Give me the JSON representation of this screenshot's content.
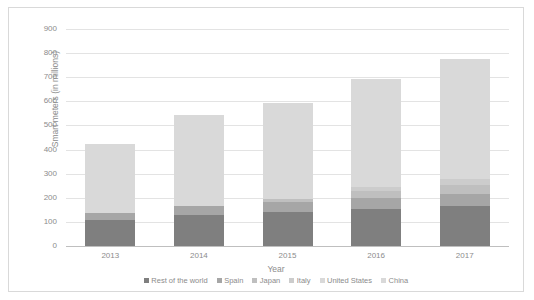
{
  "chart_data": {
    "type": "bar",
    "title": "",
    "subtitle": "",
    "stacked": true,
    "xlabel": "Year",
    "ylabel": "Smart meters (in millions)",
    "categories": [
      "2013",
      "2014",
      "2015",
      "2016",
      "2017"
    ],
    "ylim": [
      0,
      900
    ],
    "ytick_step": 100,
    "yticks": [
      "900",
      "800",
      "700",
      "600",
      "500",
      "400",
      "300",
      "200",
      "100",
      "0"
    ],
    "grid": true,
    "legend_position": "bottom",
    "series": [
      {
        "name": "Rest of the world",
        "color": "#7f7f7f",
        "values": [
          108,
          128,
          140,
          152,
          165
        ]
      },
      {
        "name": "Spain",
        "color": "#a6a6a6",
        "values": [
          30,
          39,
          44,
          48,
          50
        ]
      },
      {
        "name": "Japan",
        "color": "#bfbfbf",
        "values": [
          0,
          0,
          12,
          28,
          40
        ]
      },
      {
        "name": "Italy",
        "color": "#cccccc",
        "values": [
          0,
          0,
          0,
          16,
          24
        ]
      },
      {
        "name": "United States",
        "color": "#d9d9d9",
        "values": [
          0,
          0,
          0,
          0,
          0
        ]
      },
      {
        "name": "China",
        "color": "#d9d9d9",
        "values": [
          285,
          376,
          397,
          449,
          497
        ]
      }
    ],
    "totals": [
      423,
      543,
      593,
      693,
      776
    ]
  },
  "axis": {
    "y_title": "Smart meters (in millions)",
    "x_title": "Year"
  }
}
